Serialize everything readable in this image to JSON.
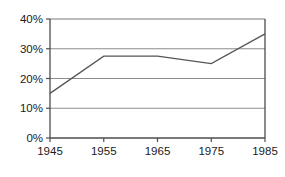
{
  "chart_data": {
    "type": "line",
    "title": "",
    "subtitle": "",
    "xlabel": "",
    "ylabel": "",
    "x": [
      1945,
      1955,
      1965,
      1975,
      1985
    ],
    "categories": [
      "1945",
      "1955",
      "1965",
      "1975",
      "1985"
    ],
    "values": [
      15,
      27.5,
      27.5,
      25,
      35
    ],
    "series": [
      {
        "name": "",
        "values": [
          15,
          27.5,
          27.5,
          25,
          35
        ]
      }
    ],
    "xlim": [
      1945,
      1985
    ],
    "ylim": [
      0,
      40
    ],
    "xtick_labels": [
      "1945",
      "1955",
      "1965",
      "1975",
      "1985"
    ],
    "ytick_labels": [
      "0%",
      "10%",
      "20%",
      "30%",
      "40%"
    ],
    "ytick_values": [
      0,
      10,
      20,
      30,
      40
    ],
    "grid": "horizontal",
    "legend": "none",
    "line_color": "#555555",
    "grid_color": "#8c8c8c",
    "axis_color": "#4d4d4d",
    "background_color": "#ffffff"
  }
}
